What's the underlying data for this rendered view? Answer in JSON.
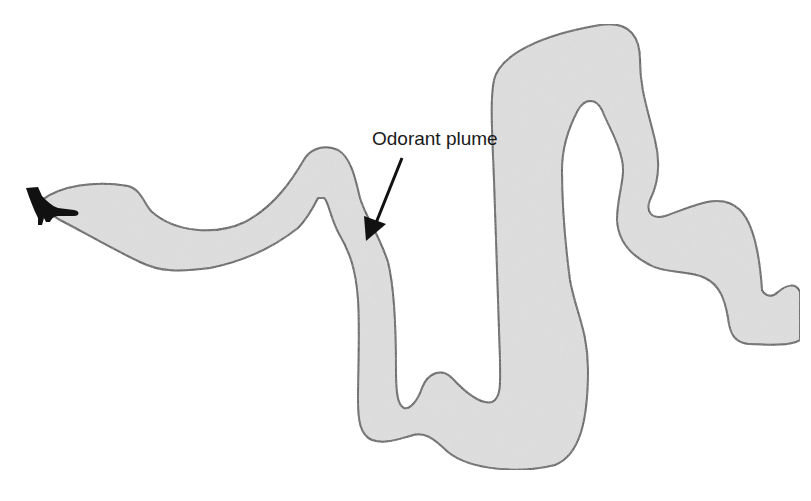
{
  "figure": {
    "title": "Odorant plume",
    "annotation": {
      "label": "Odorant plume",
      "arrow_target": "plume"
    },
    "elements": {
      "plume": {
        "fill": "#d8d8d8",
        "stroke": "#3a3a3a"
      },
      "moth": {
        "fill": "#111111",
        "icon": "moth-icon"
      },
      "arrow": {
        "color": "#111111"
      }
    }
  }
}
